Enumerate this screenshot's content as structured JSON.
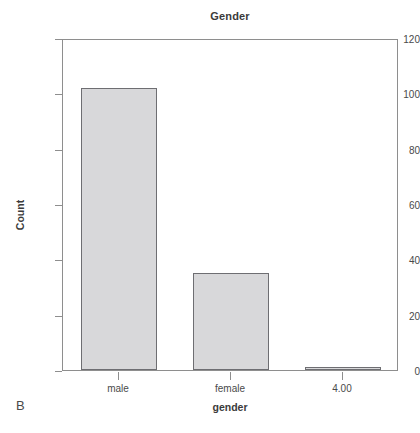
{
  "panel": {
    "label": "B"
  },
  "chart_data": {
    "type": "bar",
    "title": "Gender",
    "xlabel": "gender",
    "ylabel": "Count",
    "categories": [
      "male",
      "female",
      "4.00"
    ],
    "values": [
      102,
      35,
      1
    ],
    "ylim": [
      0,
      120
    ],
    "yticks": [
      0,
      20,
      40,
      60,
      80,
      100,
      120
    ],
    "ytick_labels": [
      "0",
      "20",
      "40",
      "60",
      "80",
      "100",
      "120"
    ],
    "grid": false,
    "legend": null,
    "bar_fill_color": "#d8d8da",
    "bar_edge_color": "#6e6e72",
    "frame_color": "#8e8e8e",
    "background_color": "#ffffff"
  }
}
